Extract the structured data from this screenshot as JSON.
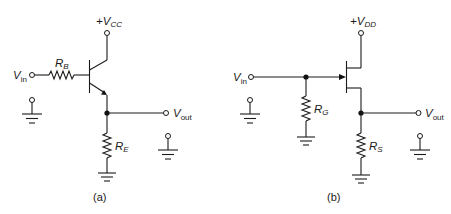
{
  "figure": {
    "circuit_a": {
      "caption": "(a)",
      "supply": {
        "prefix": "+V",
        "sub": "CC"
      },
      "input": {
        "main": "V",
        "sub": "in"
      },
      "output": {
        "main": "V",
        "sub": "out"
      },
      "base_resistor": {
        "main": "R",
        "sub": "B"
      },
      "emitter_resistor": {
        "main": "R",
        "sub": "E"
      },
      "device": "npn-bjt-emitter-follower"
    },
    "circuit_b": {
      "caption": "(b)",
      "supply": {
        "prefix": "+V",
        "sub": "DD"
      },
      "input": {
        "main": "V",
        "sub": "in"
      },
      "output": {
        "main": "V",
        "sub": "out"
      },
      "gate_resistor": {
        "main": "R",
        "sub": "G"
      },
      "source_resistor": {
        "main": "R",
        "sub": "S"
      },
      "device": "n-channel-jfet-source-follower"
    },
    "colors": {
      "ink": "#1a1a1a",
      "background": "#ffffff"
    }
  }
}
